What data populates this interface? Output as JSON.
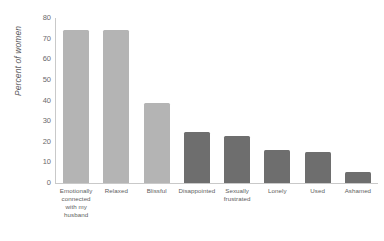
{
  "chart_data": {
    "type": "bar",
    "title": "",
    "subtitle": "",
    "xlabel": "",
    "ylabel": "Percent of women",
    "ylim": [
      0,
      80
    ],
    "yticks": [
      80,
      70,
      60,
      50,
      40,
      30,
      20,
      10,
      0
    ],
    "grid": false,
    "legend": "none",
    "categories": [
      "Emotionally connected with my husband",
      "Relaxed",
      "Blissful",
      "Disappointed",
      "Sexually frustrated",
      "Lonely",
      "Used",
      "Ashamed"
    ],
    "category_lines": [
      [
        "Emotionally",
        "connected",
        "with my",
        "husband"
      ],
      [
        "Relaxed"
      ],
      [
        "Blissful"
      ],
      [
        "Disappointed"
      ],
      [
        "Sexually",
        "frustrated"
      ],
      [
        "Lonely"
      ],
      [
        "Used"
      ],
      [
        "Ashamed"
      ]
    ],
    "values": [
      74,
      74,
      39,
      24.5,
      23,
      16,
      15,
      5.5
    ],
    "bar_colors": [
      "#b4b4b4",
      "#b4b4b4",
      "#b4b4b4",
      "#6e6e6e",
      "#6e6e6e",
      "#6e6e6e",
      "#6e6e6e",
      "#6e6e6e"
    ]
  },
  "colors": {
    "positive_bar": "#b4b4b4",
    "negative_bar": "#6e6e6e",
    "axis": "#c9c9c9",
    "text": "#5e5e60",
    "background": "#ffffff"
  }
}
